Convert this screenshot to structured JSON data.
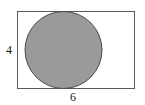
{
  "figure": {
    "type": "geometry-diagram",
    "background_color": "#ffffff",
    "rectangle": {
      "name": "outer-rectangle",
      "width_units": 6,
      "height_units": 4,
      "fill_color": "#ffffff",
      "stroke_color": "#5a5a5a",
      "stroke_width_px": 1,
      "x_px": 17,
      "y_px": 11,
      "width_px": 118,
      "height_px": 78
    },
    "circle": {
      "name": "inscribed-circle",
      "diameter_units": 4,
      "radius_units": 2,
      "fill_color": "#9a9a9a",
      "stroke_color": "#4a4a4a",
      "stroke_width_px": 1,
      "center_x_px": 63.5,
      "center_y_px": 50,
      "radius_px": 39
    },
    "labels": {
      "height": {
        "name": "height-dimension-label",
        "text": "4",
        "position": "left",
        "color": "#1a1a1a"
      },
      "width": {
        "name": "width-dimension-label",
        "text": "6",
        "position": "bottom",
        "color": "#1a1a1a"
      }
    }
  },
  "chart_data": {
    "type": "diagram",
    "title": "",
    "xlabel": "6",
    "ylabel": "4",
    "shapes": [
      {
        "shape": "rectangle",
        "label": "outer rectangle",
        "width": 6,
        "height": 4,
        "fill": "#ffffff",
        "stroke": "#5a5a5a"
      },
      {
        "shape": "circle",
        "label": "inscribed shaded circle",
        "diameter": 4,
        "radius": 2,
        "fill": "#9a9a9a",
        "stroke": "#4a4a4a"
      }
    ],
    "annotations": [
      "4",
      "6"
    ]
  }
}
